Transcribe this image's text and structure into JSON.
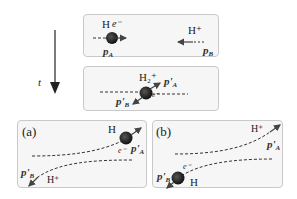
{
  "time_axis": {
    "label": "t",
    "direction": "down"
  },
  "panels": {
    "initial": {
      "particle_A": {
        "label": "H",
        "electron": "e⁻",
        "momentum": "p",
        "momentum_sub": "A"
      },
      "particle_B": {
        "label": "H⁺",
        "momentum": "p",
        "momentum_sub": "B"
      }
    },
    "collision": {
      "molecule": "H₂⁺",
      "momentum_A": "p'",
      "momentum_A_sub": "A",
      "momentum_B": "p'",
      "momentum_B_sub": "B",
      "electron": "e⁻"
    },
    "outcome_a": {
      "tag": "(a)",
      "particle_top": "H",
      "electron": "e⁻",
      "momentum_top": "p'",
      "momentum_top_sub": "A",
      "particle_bottom": "H⁺",
      "momentum_bottom": "p'",
      "momentum_bottom_sub": "B"
    },
    "outcome_b": {
      "tag": "(b)",
      "particle_top": "H⁺",
      "momentum_top": "p'",
      "momentum_top_sub": "A",
      "particle_bottom": "H",
      "electron": "e⁻",
      "momentum_bottom": "p'",
      "momentum_bottom_sub": "B"
    }
  },
  "colors": {
    "panel_bg": "#f6f6f6",
    "panel_border": "#c9c9c9",
    "ink": "#222222",
    "arrow": "#444444"
  }
}
